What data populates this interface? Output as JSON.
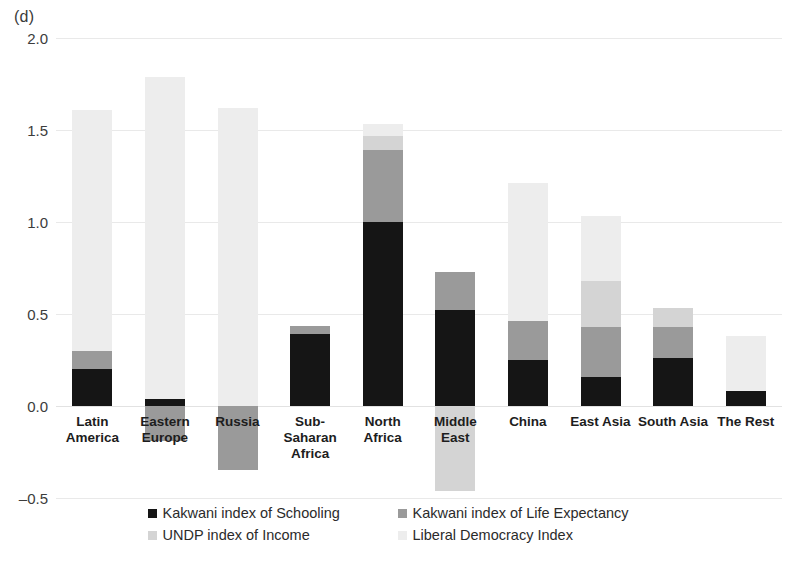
{
  "panel": {
    "label": "(d)"
  },
  "chart_data": {
    "type": "bar",
    "subtype": "stacked",
    "title": "",
    "xlabel": "",
    "ylabel": "",
    "ylim": [
      -0.5,
      2.0
    ],
    "yticks": [
      2.0,
      1.5,
      1.0,
      0.5,
      0.0,
      -0.5
    ],
    "ytick_labels": [
      "2.0",
      "1.5",
      "1.0",
      "0.5",
      "0.0",
      "–0.5"
    ],
    "grid": true,
    "legend_position": "bottom",
    "categories": [
      "Latin America",
      "Eastern Europe",
      "Russia",
      "Sub-Saharan Africa",
      "North Africa",
      "Middle East",
      "China",
      "East Asia",
      "South Asia",
      "The Rest"
    ],
    "category_labels": [
      "Latin\nAmerica",
      "Eastern\nEurope",
      "Russia",
      "Sub-\nSaharan\nAfrica",
      "North\nAfrica",
      "Middle East",
      "China",
      "East Asia",
      "South Asia",
      "The Rest"
    ],
    "series": [
      {
        "name": "Kakwani index of Schooling",
        "color": "#151515",
        "values": [
          0.2,
          0.04,
          0.0,
          0.39,
          1.0,
          0.52,
          0.25,
          0.16,
          0.26,
          0.08
        ]
      },
      {
        "name": "Kakwani index of Life Expectancy",
        "color": "#9a9a9a",
        "values": [
          0.1,
          -0.19,
          -0.35,
          0.045,
          0.39,
          0.21,
          0.21,
          0.27,
          0.17,
          0.0
        ]
      },
      {
        "name": "UNDP index of Income",
        "color": "#d4d4d4",
        "values": [
          0.0,
          0.0,
          0.0,
          0.0,
          0.08,
          -0.46,
          0.0,
          0.25,
          0.1,
          0.0
        ]
      },
      {
        "name": "Liberal Democracy Index",
        "color": "#ededed",
        "values": [
          1.31,
          1.75,
          1.62,
          0.0,
          0.06,
          0.0,
          0.75,
          0.35,
          0.0,
          0.3
        ]
      }
    ],
    "totals_positive": [
      1.61,
      1.79,
      1.62,
      0.435,
      1.53,
      0.73,
      1.21,
      1.03,
      0.53,
      0.38
    ],
    "totals_negative": [
      0.0,
      -0.19,
      -0.35,
      0.0,
      0.0,
      -0.46,
      0.0,
      0.0,
      0.0,
      0.0
    ]
  },
  "legend": {
    "rows": [
      [
        {
          "label": "Kakwani index of Schooling",
          "color": "#151515"
        },
        {
          "label": "Kakwani index of Life Expectancy",
          "color": "#9a9a9a"
        }
      ],
      [
        {
          "label": "UNDP index of Income",
          "color": "#d4d4d4"
        },
        {
          "label": "Liberal Democracy Index",
          "color": "#ededed"
        }
      ]
    ]
  }
}
